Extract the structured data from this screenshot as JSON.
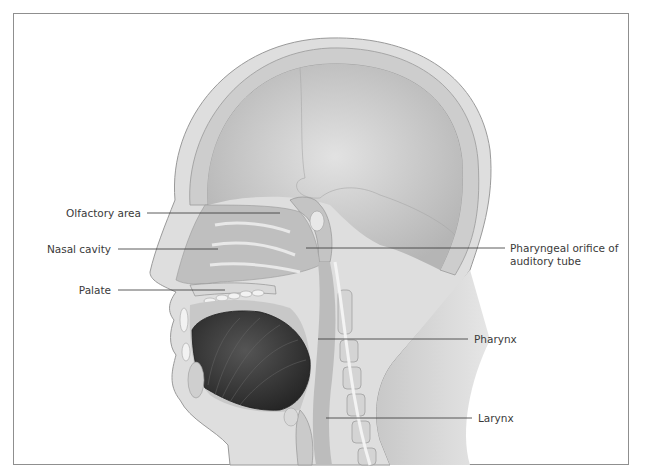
{
  "figure": {
    "colors": {
      "skin": "#dcdcdc",
      "skin_outline": "#9a9a9a",
      "bone": "#cfcfcf",
      "cranial_cavity": "#d2d2d2",
      "tongue": "#3a3a3a",
      "leader_line": "#333333",
      "frame": "#8f8f8f"
    }
  },
  "labels": {
    "left": [
      {
        "id": "olfactory-area",
        "text": "Olfactory area"
      },
      {
        "id": "nasal-cavity",
        "text": "Nasal cavity"
      },
      {
        "id": "palate",
        "text": "Palate"
      }
    ],
    "right": [
      {
        "id": "pharyngeal-orifice",
        "text": "Pharyngeal orifice of",
        "text2": "auditory tube"
      },
      {
        "id": "pharynx",
        "text": "Pharynx"
      },
      {
        "id": "larynx",
        "text": "Larynx"
      }
    ]
  }
}
